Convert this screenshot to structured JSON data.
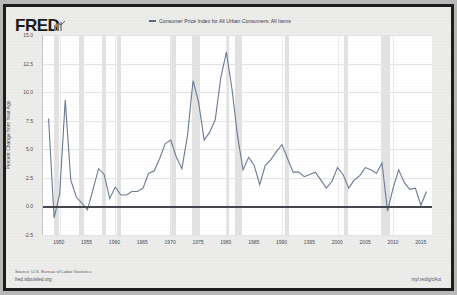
{
  "header": {
    "logo_text": "FRED",
    "logo_mark": "chart-mark-icon",
    "legend_label": "Consumer Price Index for All Urban Consumers: All Items",
    "legend_color": "#5a6a86"
  },
  "footer": {
    "source": "Source: U.S. Bureau of Labor Statistics",
    "url": "fred.stlouisfed.org",
    "short_url": "myf.red/g/cAut"
  },
  "chart_data": {
    "type": "line",
    "title": "",
    "xlabel": "",
    "ylabel": "Percent Change from Year Ago",
    "xlim": [
      1947,
      2017
    ],
    "ylim": [
      -2.5,
      15.0
    ],
    "grid": true,
    "legend_position": "top-center",
    "yticks": [
      "15.0",
      "12.5",
      "10.0",
      "7.5",
      "5.0",
      "2.5",
      "0.0",
      "-2.5"
    ],
    "ytick_values": [
      15.0,
      12.5,
      10.0,
      7.5,
      5.0,
      2.5,
      0.0,
      -2.5
    ],
    "xticks": [
      "1950",
      "1955",
      "1960",
      "1965",
      "1970",
      "1975",
      "1980",
      "1985",
      "1990",
      "1995",
      "2000",
      "2005",
      "2010",
      "2015"
    ],
    "xtick_values": [
      1950,
      1955,
      1960,
      1965,
      1970,
      1975,
      1980,
      1985,
      1990,
      1995,
      2000,
      2005,
      2010,
      2015
    ],
    "zero_line": 0.0,
    "series": [
      {
        "name": "Consumer Price Index for All Urban Consumers: All Items",
        "color": "#6b7a93",
        "x": [
          1948,
          1949,
          1950,
          1951,
          1952,
          1953,
          1954,
          1955,
          1956,
          1957,
          1958,
          1959,
          1960,
          1961,
          1962,
          1963,
          1964,
          1965,
          1966,
          1967,
          1968,
          1969,
          1970,
          1971,
          1972,
          1973,
          1974,
          1975,
          1976,
          1977,
          1978,
          1979,
          1980,
          1981,
          1982,
          1983,
          1984,
          1985,
          1986,
          1987,
          1988,
          1989,
          1990,
          1991,
          1992,
          1993,
          1994,
          1995,
          1996,
          1997,
          1998,
          1999,
          2000,
          2001,
          2002,
          2003,
          2004,
          2005,
          2006,
          2007,
          2008,
          2009,
          2010,
          2011,
          2012,
          2013,
          2014,
          2015,
          2016
        ],
        "values": [
          7.7,
          -1.0,
          1.1,
          9.3,
          2.3,
          0.8,
          0.3,
          -0.3,
          1.5,
          3.3,
          2.8,
          0.7,
          1.7,
          1.0,
          1.0,
          1.3,
          1.3,
          1.6,
          2.9,
          3.1,
          4.2,
          5.5,
          5.8,
          4.3,
          3.3,
          6.2,
          11.0,
          9.1,
          5.8,
          6.5,
          7.6,
          11.3,
          13.5,
          10.3,
          6.2,
          3.2,
          4.3,
          3.6,
          1.9,
          3.6,
          4.1,
          4.8,
          5.4,
          4.2,
          3.0,
          3.0,
          2.6,
          2.8,
          3.0,
          2.3,
          1.6,
          2.2,
          3.4,
          2.8,
          1.6,
          2.3,
          2.7,
          3.4,
          3.2,
          2.9,
          3.8,
          -0.4,
          1.6,
          3.2,
          2.1,
          1.5,
          1.6,
          0.1,
          1.3
        ]
      }
    ],
    "recession_bands": [
      {
        "start": 1948.9,
        "end": 1949.8
      },
      {
        "start": 1953.5,
        "end": 1954.4
      },
      {
        "start": 1957.6,
        "end": 1958.3
      },
      {
        "start": 1960.3,
        "end": 1961.1
      },
      {
        "start": 1969.9,
        "end": 1970.9
      },
      {
        "start": 1973.9,
        "end": 1975.2
      },
      {
        "start": 1980.0,
        "end": 1980.5
      },
      {
        "start": 1981.5,
        "end": 1982.9
      },
      {
        "start": 1990.5,
        "end": 1991.2
      },
      {
        "start": 2001.2,
        "end": 2001.9
      },
      {
        "start": 2007.9,
        "end": 2009.5
      }
    ]
  }
}
